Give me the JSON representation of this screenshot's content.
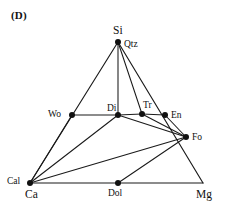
{
  "figure": {
    "panel_label": "(D)",
    "type": "ternary-phase-diagram",
    "line_color": "#1a1a1a",
    "dot_color": "#111111",
    "background": "#ffffff"
  },
  "corners": {
    "top": {
      "label": "Si",
      "x": 118,
      "y": 42
    },
    "bottom_left": {
      "label": "Ca",
      "x": 30,
      "y": 183
    },
    "bottom_right": {
      "label": "Mg",
      "x": 203,
      "y": 183
    }
  },
  "nodes": [
    {
      "id": "qtz",
      "label": "Qtz",
      "x": 118,
      "y": 42,
      "label_dx": 6,
      "label_dy": 5,
      "dot": true
    },
    {
      "id": "wo",
      "label": "Wo",
      "x": 72,
      "y": 115,
      "label_dx": -24,
      "label_dy": 2,
      "dot": true
    },
    {
      "id": "di",
      "label": "Di",
      "x": 118,
      "y": 115,
      "label_dx": -11,
      "label_dy": -4,
      "dot": true
    },
    {
      "id": "tr",
      "label": "Tr",
      "x": 142,
      "y": 114,
      "label_dx": 1,
      "label_dy": -6,
      "dot": true
    },
    {
      "id": "en",
      "label": "En",
      "x": 165,
      "y": 115,
      "label_dx": 6,
      "label_dy": 3,
      "dot": true
    },
    {
      "id": "fo",
      "label": "Fo",
      "x": 186,
      "y": 137,
      "label_dx": 6,
      "label_dy": 3,
      "dot": true
    },
    {
      "id": "cal",
      "label": "Cal",
      "x": 30,
      "y": 183,
      "label_dx": -23,
      "label_dy": 1,
      "dot": true
    },
    {
      "id": "dol",
      "label": "Dol",
      "x": 118,
      "y": 183,
      "label_dx": -10,
      "label_dy": 13,
      "dot": true
    }
  ],
  "corner_labels": [
    {
      "id": "si-corner",
      "label": "Si",
      "x": 113,
      "y": 34
    },
    {
      "id": "ca-corner",
      "label": "Ca",
      "x": 25,
      "y": 198
    },
    {
      "id": "mg-corner",
      "label": "Mg",
      "x": 196,
      "y": 198
    }
  ],
  "edges": [
    {
      "id": "si-cal",
      "from": [
        118,
        42
      ],
      "to": [
        30,
        183
      ],
      "kind": "edge"
    },
    {
      "id": "si-mg",
      "from": [
        118,
        42
      ],
      "to": [
        203,
        183
      ],
      "kind": "edge"
    },
    {
      "id": "cal-mg",
      "from": [
        30,
        183
      ],
      "to": [
        203,
        183
      ],
      "kind": "edge"
    }
  ],
  "tie_lines": [
    {
      "id": "si-di",
      "from": [
        118,
        42
      ],
      "to": [
        118,
        115
      ]
    },
    {
      "id": "si-tr",
      "from": [
        118,
        42
      ],
      "to": [
        142,
        114
      ]
    },
    {
      "id": "wo-di",
      "from": [
        72,
        115
      ],
      "to": [
        118,
        115
      ]
    },
    {
      "id": "di-tr",
      "from": [
        118,
        115
      ],
      "to": [
        142,
        114
      ]
    },
    {
      "id": "tr-en",
      "from": [
        142,
        114
      ],
      "to": [
        165,
        115
      ]
    },
    {
      "id": "di-fo",
      "from": [
        118,
        115
      ],
      "to": [
        186,
        137
      ]
    },
    {
      "id": "tr-fo",
      "from": [
        142,
        114
      ],
      "to": [
        186,
        137
      ]
    },
    {
      "id": "en-fo",
      "from": [
        165,
        115
      ],
      "to": [
        186,
        137
      ]
    },
    {
      "id": "cal-wo",
      "from": [
        30,
        183
      ],
      "to": [
        72,
        115
      ]
    },
    {
      "id": "cal-di",
      "from": [
        30,
        183
      ],
      "to": [
        118,
        115
      ]
    },
    {
      "id": "cal-fo",
      "from": [
        30,
        183
      ],
      "to": [
        186,
        137
      ]
    },
    {
      "id": "dol-fo",
      "from": [
        118,
        183
      ],
      "to": [
        186,
        137
      ]
    }
  ],
  "chart_data": {
    "type": "scatter",
    "title": "(D)",
    "xlabel": "",
    "ylabel": "",
    "apexes": [
      "Si",
      "Ca",
      "Mg"
    ],
    "phases": [
      "Qtz",
      "Wo",
      "Di",
      "Tr",
      "En",
      "Fo",
      "Cal",
      "Dol"
    ],
    "points": [
      {
        "name": "Qtz",
        "x": 118,
        "y": 42
      },
      {
        "name": "Wo",
        "x": 72,
        "y": 115
      },
      {
        "name": "Di",
        "x": 118,
        "y": 115
      },
      {
        "name": "Tr",
        "x": 142,
        "y": 114
      },
      {
        "name": "En",
        "x": 165,
        "y": 115
      },
      {
        "name": "Fo",
        "x": 186,
        "y": 137
      },
      {
        "name": "Cal",
        "x": 30,
        "y": 183
      },
      {
        "name": "Dol",
        "x": 118,
        "y": 183
      }
    ],
    "connections": [
      [
        "Si",
        "Cal"
      ],
      [
        "Si",
        "Mg"
      ],
      [
        "Cal",
        "Mg"
      ],
      [
        "Si",
        "Di"
      ],
      [
        "Si",
        "Tr"
      ],
      [
        "Wo",
        "Di"
      ],
      [
        "Di",
        "Tr"
      ],
      [
        "Tr",
        "En"
      ],
      [
        "Di",
        "Fo"
      ],
      [
        "Tr",
        "Fo"
      ],
      [
        "En",
        "Fo"
      ],
      [
        "Cal",
        "Wo"
      ],
      [
        "Cal",
        "Di"
      ],
      [
        "Cal",
        "Fo"
      ],
      [
        "Dol",
        "Fo"
      ]
    ],
    "grid": false,
    "legend": "none"
  }
}
